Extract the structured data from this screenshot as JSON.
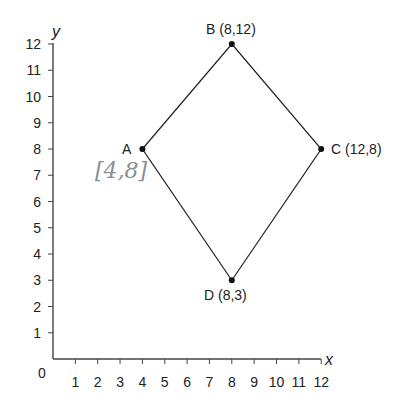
{
  "figure": {
    "axes": {
      "x_label": "x",
      "y_label": "y",
      "origin_label": "0",
      "x_ticks": [
        "1",
        "2",
        "3",
        "4",
        "5",
        "6",
        "7",
        "8",
        "9",
        "10",
        "11",
        "12"
      ],
      "y_ticks": [
        "1",
        "2",
        "3",
        "4",
        "5",
        "6",
        "7",
        "8",
        "9",
        "10",
        "11",
        "12"
      ]
    },
    "points": [
      {
        "name": "A",
        "x": 4,
        "y": 8,
        "label": "A"
      },
      {
        "name": "B",
        "x": 8,
        "y": 12,
        "label": "B (8,12)"
      },
      {
        "name": "C",
        "x": 12,
        "y": 8,
        "label": "C (12,8)"
      },
      {
        "name": "D",
        "x": 8,
        "y": 3,
        "label": "D (8,3)"
      }
    ],
    "handwritten_annotation": "[4,8]"
  },
  "chart_data": {
    "type": "scatter",
    "title": "",
    "xlabel": "x",
    "ylabel": "y",
    "xlim": [
      0,
      12
    ],
    "ylim": [
      0,
      12
    ],
    "grid": false,
    "series": [
      {
        "name": "kite ABCD",
        "points": [
          {
            "label": "A",
            "x": 4,
            "y": 8
          },
          {
            "label": "B",
            "x": 8,
            "y": 12
          },
          {
            "label": "C",
            "x": 12,
            "y": 8
          },
          {
            "label": "D",
            "x": 8,
            "y": 3
          }
        ],
        "closed_polygon": true
      }
    ],
    "annotations": [
      "A",
      "B (8,12)",
      "C (12,8)",
      "D (8,3)",
      "[4,8] (handwritten)"
    ]
  }
}
